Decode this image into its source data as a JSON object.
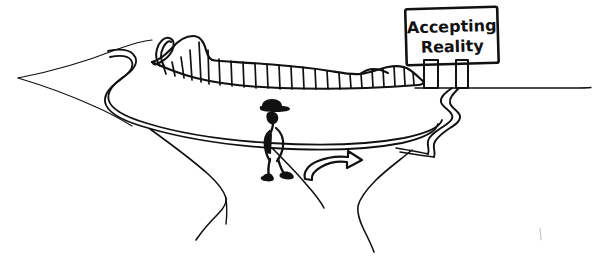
{
  "illustration": {
    "title": "Accepting Reality road sign illustration",
    "background_color": "#ffffff",
    "ink_color": "#111111",
    "style": "black and white hand-drawn line art"
  },
  "sign": {
    "name": "roadside signboard",
    "line1": "Accepting",
    "line2": "Reality",
    "post_count": 2,
    "board_color": "#ffffff",
    "border_color": "#111111"
  },
  "figure": {
    "name": "walking person with hat",
    "hat": "wide-brim hat",
    "shoe_color": "#111111"
  },
  "arrow": {
    "name": "curved direction arrow",
    "direction": "right",
    "style": "hollow outline"
  },
  "scenery": {
    "hedge": "serrated hedgerow along horizon",
    "loop": "small looped tree at hedge left end",
    "horizon": "thin sloping horizon line",
    "road": "winding double-line road forking at foreground"
  }
}
